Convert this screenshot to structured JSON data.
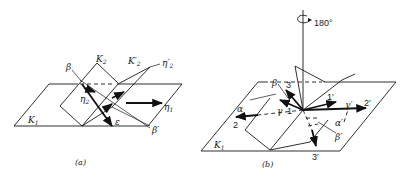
{
  "figure": {
    "panel_a": {
      "caption": "(a)",
      "labels": {
        "K1": "K",
        "K1_sub": "1",
        "K2": "K",
        "K2_sub": "2",
        "K2prime": "K′",
        "K2prime_sub": "2",
        "eta1": "η",
        "eta1_sub": "1",
        "eta2": "η",
        "eta2_sub": "2",
        "eta2prime": "η′",
        "eta2prime_sub": "2",
        "beta": "β",
        "beta_prime": "β′",
        "epsilon": "ε"
      }
    },
    "panel_b": {
      "caption": "(b)",
      "rotation_label": "180°",
      "labels": {
        "K1": "K",
        "K1_sub": "1",
        "alpha": "α",
        "beta": "β",
        "gamma": "γ",
        "alpha_prime": "α′",
        "beta_prime": "β′",
        "gamma_prime": "γ′",
        "axis1": "1",
        "axis2": "2",
        "axis3": "3",
        "axis1_prime": "1′",
        "axis2_prime": "2′",
        "axis3_prime": "3′"
      }
    }
  }
}
